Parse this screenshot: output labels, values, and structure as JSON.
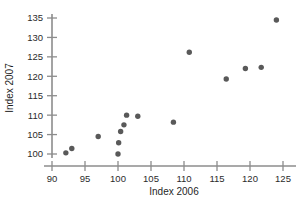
{
  "chart_data": {
    "type": "scatter",
    "title": "",
    "xlabel": "Index 2006",
    "ylabel": "Index 2007",
    "xlim": [
      89.0,
      125.8
    ],
    "ylim": [
      98.2,
      136.5
    ],
    "xticks": [
      90,
      95,
      100,
      105,
      110,
      115,
      120,
      125
    ],
    "xtick_labels": [
      "90",
      "95",
      "100",
      "105",
      "110",
      "115",
      "120",
      "125"
    ],
    "yticks": [
      100,
      105,
      110,
      115,
      120,
      125,
      130,
      135
    ],
    "ytick_labels": [
      "100",
      "105",
      "110",
      "115",
      "120",
      "125",
      "130",
      "135"
    ],
    "grid": false,
    "legend": false,
    "marker": "circle",
    "marker_color": "#595959",
    "axis_color": "#8c8c8c",
    "points": [
      {
        "x": 92.1,
        "y": 100.3
      },
      {
        "x": 93.0,
        "y": 101.4
      },
      {
        "x": 97.0,
        "y": 104.5
      },
      {
        "x": 100.0,
        "y": 100.0
      },
      {
        "x": 100.1,
        "y": 102.9
      },
      {
        "x": 100.4,
        "y": 105.8
      },
      {
        "x": 100.9,
        "y": 107.5
      },
      {
        "x": 101.3,
        "y": 110.0
      },
      {
        "x": 103.0,
        "y": 109.7
      },
      {
        "x": 108.4,
        "y": 108.2
      },
      {
        "x": 110.8,
        "y": 126.2
      },
      {
        "x": 116.4,
        "y": 119.3
      },
      {
        "x": 119.3,
        "y": 122.0
      },
      {
        "x": 121.7,
        "y": 122.3
      },
      {
        "x": 124.0,
        "y": 134.5
      }
    ]
  }
}
